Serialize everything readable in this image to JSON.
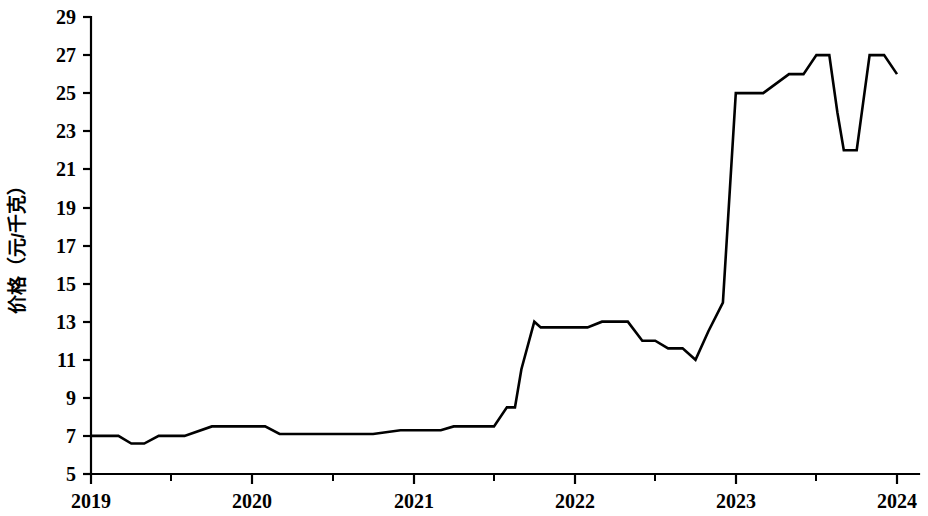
{
  "chart_data": {
    "type": "line",
    "title": "",
    "subtitle": "",
    "xlabel": "",
    "ylabel": "价格（元/千克）",
    "xlim": [
      2019.0,
      2024.0
    ],
    "ylim": [
      5,
      29
    ],
    "grid": false,
    "legend": null,
    "legend_position": "none",
    "line_color": "#000000",
    "background_color": "#ffffff",
    "y_ticks": [
      5,
      7,
      9,
      11,
      13,
      15,
      17,
      19,
      21,
      23,
      25,
      27,
      29
    ],
    "y_tick_labels": [
      "5",
      "7",
      "9",
      "11",
      "13",
      "15",
      "17",
      "19",
      "21",
      "23",
      "25",
      "27",
      "29"
    ],
    "x_ticks": [
      2019,
      2020,
      2021,
      2022,
      2023,
      2024
    ],
    "x_tick_labels": [
      "2019",
      "2020",
      "2021",
      "2022",
      "2023",
      "2024"
    ],
    "x_minor_ticks": [
      2019.5,
      2020.5,
      2021.5,
      2022.5,
      2023.5
    ],
    "series": [
      {
        "name": "价格",
        "x": [
          2019.0,
          2019.17,
          2019.25,
          2019.33,
          2019.42,
          2019.5,
          2019.58,
          2019.75,
          2019.83,
          2020.08,
          2020.17,
          2020.25,
          2020.33,
          2020.58,
          2020.75,
          2020.92,
          2021.0,
          2021.17,
          2021.25,
          2021.42,
          2021.5,
          2021.58,
          2021.63,
          2021.67,
          2021.75,
          2021.79,
          2021.83,
          2022.0,
          2022.08,
          2022.17,
          2022.25,
          2022.33,
          2022.42,
          2022.5,
          2022.58,
          2022.67,
          2022.75,
          2022.83,
          2022.92,
          2023.0,
          2023.17,
          2023.33,
          2023.42,
          2023.5,
          2023.58,
          2023.63,
          2023.67,
          2023.75,
          2023.79,
          2023.83,
          2023.92,
          2024.0
        ],
        "y": [
          7.0,
          7.0,
          6.6,
          6.6,
          7.0,
          7.0,
          7.0,
          7.5,
          7.5,
          7.5,
          7.1,
          7.1,
          7.1,
          7.1,
          7.1,
          7.3,
          7.3,
          7.3,
          7.5,
          7.5,
          7.5,
          8.5,
          8.5,
          10.5,
          13.0,
          12.7,
          12.7,
          12.7,
          12.7,
          13.0,
          13.0,
          13.0,
          12.0,
          12.0,
          11.6,
          11.6,
          11.0,
          12.5,
          14.0,
          25.0,
          25.0,
          26.0,
          26.0,
          27.0,
          27.0,
          24.0,
          22.0,
          22.0,
          24.5,
          27.0,
          27.0,
          26.0
        ]
      }
    ],
    "annotations": []
  },
  "axes": {
    "y_axis_title": "价格（元/千克）"
  }
}
